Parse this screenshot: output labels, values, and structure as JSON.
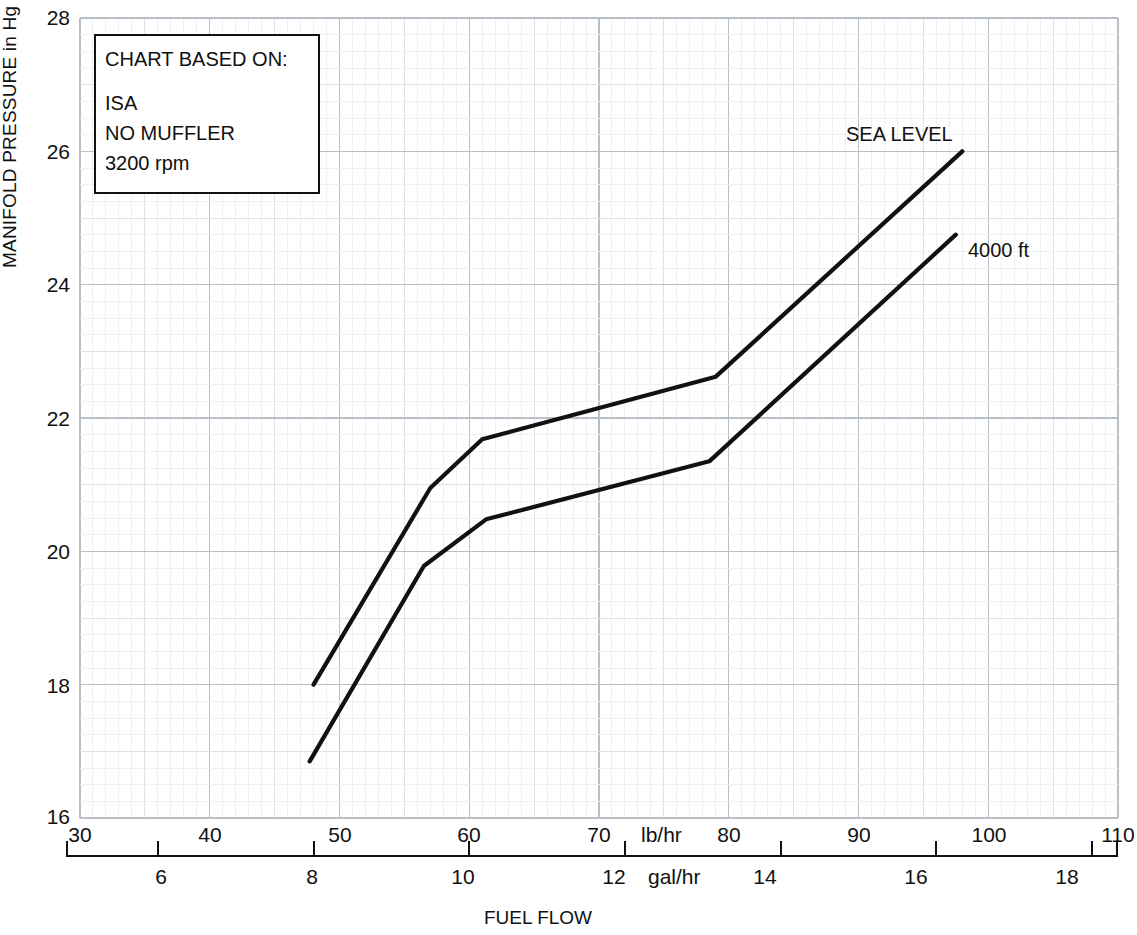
{
  "chart_data": {
    "type": "line",
    "title": "",
    "xlabel": "FUEL FLOW",
    "ylabel": "MANIFOLD PRESSURE in Hg",
    "x_unit_primary": "lb/hr",
    "x_unit_secondary": "gal/hr",
    "xlim": [
      30,
      110
    ],
    "ylim": [
      16,
      28
    ],
    "x_ticks": [
      30,
      40,
      50,
      60,
      70,
      80,
      90,
      100,
      110
    ],
    "x_ticks_secondary": [
      6,
      8,
      10,
      12,
      14,
      16,
      18
    ],
    "y_ticks": [
      16,
      18,
      20,
      22,
      24,
      26,
      28
    ],
    "grid": true,
    "legend_position": "inline-right",
    "series": [
      {
        "name": "SEA LEVEL",
        "points": [
          [
            48.0,
            18.0
          ],
          [
            57.0,
            20.95
          ],
          [
            61.0,
            21.68
          ],
          [
            79.0,
            22.62
          ],
          [
            98.0,
            26.0
          ]
        ]
      },
      {
        "name": "4000 ft",
        "points": [
          [
            47.7,
            16.85
          ],
          [
            56.5,
            19.78
          ],
          [
            61.3,
            20.48
          ],
          [
            78.5,
            21.35
          ],
          [
            97.5,
            24.75
          ]
        ]
      }
    ],
    "annotation": {
      "heading": "CHART BASED ON:",
      "lines": [
        "ISA",
        "NO MUFFLER",
        "3200 rpm"
      ]
    },
    "colors": {
      "curve": "#111111",
      "grid_major": "#b9bfc6",
      "grid_minor": "#eef0f2",
      "axis": "#111111",
      "background": "#ffffff"
    }
  },
  "labels": {
    "y_title": "MANIFOLD PRESSURE in Hg",
    "x_title": "FUEL FLOW",
    "lb_unit": "lb/hr",
    "gal_unit": "gal/hr",
    "series_sea_level": "SEA LEVEL",
    "series_4000ft": "4000 ft",
    "y_28": "28",
    "y_26": "26",
    "y_24": "24",
    "y_22": "22",
    "y_20": "20",
    "y_18": "18",
    "y_16": "16",
    "x_30": "30",
    "x_40": "40",
    "x_50": "50",
    "x_60": "60",
    "x_70": "70",
    "x_80": "80",
    "x_90": "90",
    "x_100": "100",
    "x_110": "110",
    "g_6": "6",
    "g_8": "8",
    "g_10": "10",
    "g_12": "12",
    "g_14": "14",
    "g_16": "16",
    "g_18": "18",
    "note_heading": "CHART BASED ON:",
    "note_1": "ISA",
    "note_2": "NO MUFFLER",
    "note_3": "3200 rpm"
  }
}
